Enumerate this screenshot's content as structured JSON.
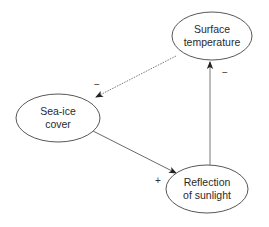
{
  "diagram": {
    "type": "causal-loop",
    "nodes": [
      {
        "id": "surface",
        "lines": [
          "Surface",
          "temperature"
        ],
        "cx": 212,
        "cy": 36,
        "rx": 40,
        "ry": 24
      },
      {
        "id": "seaice",
        "lines": [
          "Sea-ice",
          "cover"
        ],
        "cx": 58,
        "cy": 118,
        "rx": 42,
        "ry": 24
      },
      {
        "id": "reflection",
        "lines": [
          "Reflection",
          "of sunlight"
        ],
        "cx": 207,
        "cy": 189,
        "rx": 41,
        "ry": 24
      }
    ],
    "edges": [
      {
        "from": "surface",
        "to": "seaice",
        "sign": "−",
        "style": "dotted"
      },
      {
        "from": "seaice",
        "to": "reflection",
        "sign": "+",
        "style": "solid"
      },
      {
        "from": "reflection",
        "to": "surface",
        "sign": "−",
        "style": "solid"
      }
    ]
  },
  "colors": {
    "stroke": "#444444",
    "background": "#ffffff",
    "text": "#2a2a2a"
  }
}
